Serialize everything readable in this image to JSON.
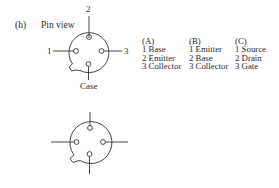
{
  "figure": {
    "label": "(h)",
    "view_label": "Pin view",
    "top_diagram": {
      "pins": [
        {
          "id": "1",
          "label": "1",
          "position": "left"
        },
        {
          "id": "2",
          "label": "2",
          "position": "top"
        },
        {
          "id": "3",
          "label": "3",
          "position": "right"
        },
        {
          "id": "case",
          "label": "Case",
          "position": "bottom"
        }
      ]
    },
    "bottom_diagram": {
      "description": "Unlabeled four-lead package outline with tab at lower-left"
    }
  },
  "pinouts": [
    {
      "header": "(A)",
      "items": [
        "1 Base",
        "2 Emitter",
        "3 Collector"
      ]
    },
    {
      "header": "(B)",
      "items": [
        "1 Emitter",
        "2 Base",
        "3 Collector"
      ]
    },
    {
      "header": "(C)",
      "items": [
        "1 Source",
        "2 Drain",
        "3 Gate"
      ]
    }
  ]
}
